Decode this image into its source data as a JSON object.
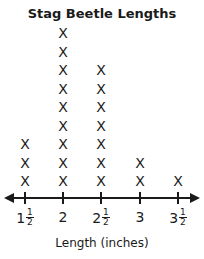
{
  "chart_data": {
    "type": "dot_plot",
    "title": "Stag Beetle Lengths",
    "xlabel": "Length (inches)",
    "ylabel": "",
    "marker": "X",
    "categories": [
      "1 1/2",
      "2",
      "2 1/2",
      "3",
      "3 1/2"
    ],
    "values": [
      3,
      9,
      7,
      2,
      1
    ],
    "tick_labels": [
      {
        "whole": "1",
        "num": "1",
        "den": "2"
      },
      {
        "whole": "2",
        "num": "",
        "den": ""
      },
      {
        "whole": "2",
        "num": "1",
        "den": "2"
      },
      {
        "whole": "3",
        "num": "",
        "den": ""
      },
      {
        "whole": "3",
        "num": "1",
        "den": "2"
      }
    ],
    "grid": false,
    "legend": null
  }
}
